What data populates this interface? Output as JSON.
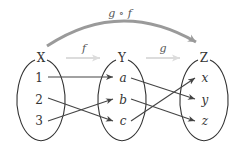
{
  "diagram": {
    "composition_label": "g ∘ f",
    "f_label": "f",
    "g_label": "g",
    "sets": [
      {
        "name": "X",
        "elements": [
          "1",
          "2",
          "3"
        ]
      },
      {
        "name": "Y",
        "elements": [
          "a",
          "b",
          "c"
        ]
      },
      {
        "name": "Z",
        "elements": [
          "x",
          "y",
          "z"
        ]
      }
    ],
    "mappings_f": [
      [
        "1",
        "a"
      ],
      [
        "2",
        "c"
      ],
      [
        "3",
        "b"
      ]
    ],
    "mappings_g": [
      [
        "a",
        "y"
      ],
      [
        "b",
        "z"
      ],
      [
        "c",
        "x"
      ]
    ],
    "colors": {
      "composition_arrow": "#9a9a9a",
      "function_arrow": "#dcdcdc",
      "mapping_arrow": "#444444",
      "ellipse": "#333333"
    }
  }
}
